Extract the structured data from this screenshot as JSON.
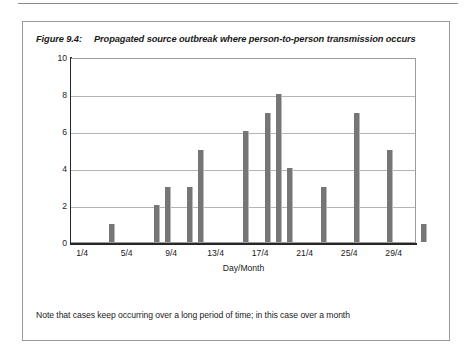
{
  "figure": {
    "caption_number": "Figure 9.4:",
    "caption_text": "Propagated source outbreak where person-to-person transmission occurs",
    "note": "Note that cases keep occurring over a long period of time; in this case over a month"
  },
  "colors": {
    "bar": "#767676",
    "grid": "#b4b4b4",
    "axis": "#262626",
    "frame": "#9a9a9a"
  },
  "chart_data": {
    "type": "bar",
    "title": "Propagated source outbreak where person-to-person transmission occurs",
    "xlabel": "Day/Month",
    "ylabel": "Number of cases",
    "ylim": [
      0,
      10
    ],
    "yticks": [
      0,
      2,
      4,
      6,
      8,
      10
    ],
    "xticks": [
      "1/4",
      "5/4",
      "9/4",
      "13/4",
      "17/4",
      "21/4",
      "25/4",
      "29/4"
    ],
    "xtick_days": [
      1,
      5,
      9,
      13,
      17,
      21,
      25,
      29
    ],
    "xlim_days": [
      0,
      31
    ],
    "grid": true,
    "legend": "none",
    "categories": [
      "1/4",
      "5/4",
      "6/4",
      "8/4",
      "9/4",
      "13/4",
      "15/4",
      "16/4",
      "17/4",
      "20/4",
      "23/4",
      "26/4",
      "29/4"
    ],
    "days": [
      1,
      5,
      6,
      8,
      9,
      13,
      15,
      16,
      17,
      20,
      23,
      26,
      29
    ],
    "values": [
      1,
      2,
      3,
      3,
      5,
      6,
      7,
      8,
      4,
      3,
      7,
      5,
      1
    ],
    "series": [
      {
        "name": "Number of cases",
        "values": [
          1,
          2,
          3,
          3,
          5,
          6,
          7,
          8,
          4,
          3,
          7,
          5,
          1
        ]
      }
    ]
  }
}
